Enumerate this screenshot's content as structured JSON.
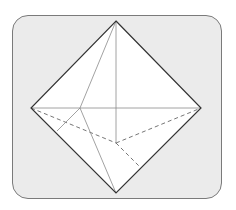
{
  "figure": {
    "type": "octahedron-wireframe",
    "frame": {
      "fill": "#ebebeb",
      "border": "#7a7a7a"
    },
    "colors": {
      "face": "#ffffff",
      "outline": "#333333",
      "inner": "#8a8a8a",
      "hidden": "#666666"
    },
    "vertices": {
      "top": [
        116,
        21
      ],
      "bottom": [
        116,
        193
      ],
      "left": [
        31,
        108
      ],
      "right": [
        201,
        108
      ],
      "front": [
        80,
        108
      ],
      "back": [
        116,
        143
      ]
    }
  }
}
